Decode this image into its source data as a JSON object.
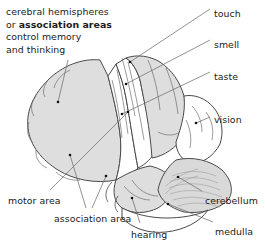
{
  "figure": {
    "caption": {
      "line1": "cerebral hemispheres",
      "line2_prefix": "or ",
      "line2_bold": "association areas",
      "line3": "control memory",
      "line4": "and thinking"
    },
    "labels": [
      {
        "id": "touch",
        "text": "touch",
        "x": 214,
        "y": 8
      },
      {
        "id": "smell",
        "text": "smell",
        "x": 214,
        "y": 39
      },
      {
        "id": "taste",
        "text": "taste",
        "x": 214,
        "y": 71
      },
      {
        "id": "vision",
        "text": "vision",
        "x": 214,
        "y": 114
      },
      {
        "id": "cerebellum",
        "text": "cerebellum",
        "x": 205,
        "y": 195
      },
      {
        "id": "medulla",
        "text": "medulla",
        "x": 215,
        "y": 226
      },
      {
        "id": "hearing",
        "text": "hearing",
        "x": 131,
        "y": 229
      },
      {
        "id": "association-area",
        "text": "association area",
        "x": 54,
        "y": 213
      },
      {
        "id": "motor-area",
        "text": "motor area",
        "x": 8,
        "y": 195
      }
    ],
    "colors": {
      "ink": "#1b1b1b",
      "outline": "#4a4a4a",
      "leader": "#6e6e6e",
      "shaded_region": "#dedede",
      "white_region": "#ffffff",
      "cerebellum_fill": "#d9d9d9",
      "dot": "#111111",
      "background": "#ffffff"
    },
    "regions": [
      {
        "id": "frontal-association",
        "name": "cerebral hemisphere / association area",
        "shading": "gray"
      },
      {
        "id": "motor-strip",
        "name": "motor area",
        "shading": "white"
      },
      {
        "id": "touch-strip",
        "name": "touch (somatosensory) area",
        "shading": "white"
      },
      {
        "id": "parietal-association",
        "name": "association area",
        "shading": "gray"
      },
      {
        "id": "smell-area",
        "name": "smell area",
        "shading": "white"
      },
      {
        "id": "taste-area",
        "name": "taste area",
        "shading": "white"
      },
      {
        "id": "occipital-vision",
        "name": "vision area",
        "shading": "white"
      },
      {
        "id": "temporal-hearing",
        "name": "hearing area",
        "shading": "gray"
      },
      {
        "id": "cerebellum",
        "name": "cerebellum",
        "shading": "striated-gray"
      },
      {
        "id": "medulla",
        "name": "medulla",
        "shading": "white"
      }
    ],
    "bottom_cut_text": "accessibility cut-off line"
  }
}
